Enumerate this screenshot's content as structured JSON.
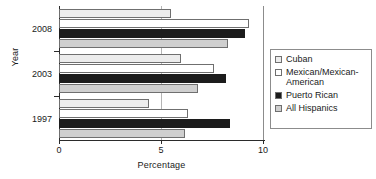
{
  "chart_data": {
    "type": "bar",
    "orientation": "horizontal",
    "title": "",
    "xlabel": "Percentage",
    "ylabel": "Year",
    "categories": [
      "2008",
      "2003",
      "1997"
    ],
    "xlim": [
      0,
      10
    ],
    "xticks": [
      0,
      5,
      10
    ],
    "xticklabels": [
      "0",
      "5",
      "10"
    ],
    "grid": true,
    "legend_position": "right",
    "series": [
      {
        "name": "Cuban",
        "color": "#ececec",
        "values": [
          5.5,
          6.0,
          4.4
        ]
      },
      {
        "name": "Mexican/Mexican-American",
        "color": "#ffffff",
        "values": [
          9.3,
          7.6,
          6.3
        ]
      },
      {
        "name": "Puerto Rican",
        "color": "#1c1c1c",
        "values": [
          9.1,
          8.2,
          8.4
        ]
      },
      {
        "name": "All Hispanics",
        "color": "#cfcfcf",
        "values": [
          8.3,
          6.8,
          6.2
        ]
      }
    ]
  },
  "axis": {
    "y_title": "Year",
    "x_title": "Percentage",
    "x_ticks": [
      "0",
      "5",
      "10"
    ],
    "y_ticks": [
      "2008",
      "2003",
      "1997"
    ]
  },
  "legend": {
    "entries": [
      {
        "label": "Cuban",
        "swatch": "light-gray"
      },
      {
        "label": "Mexican/Mexican-\nAmerican",
        "swatch": "white"
      },
      {
        "label": "Puerto Rican",
        "swatch": "black"
      },
      {
        "label": "All Hispanics",
        "swatch": "gray"
      }
    ]
  }
}
